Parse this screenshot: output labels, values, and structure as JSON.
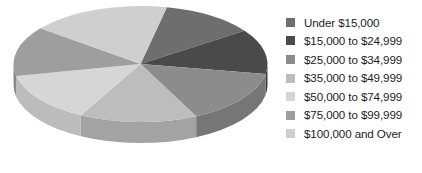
{
  "chart_data": {
    "type": "pie",
    "title": "",
    "subtitle": "",
    "xlabel": "",
    "ylabel": "",
    "three_d": true,
    "start_angle_deg": 12,
    "direction": "clockwise",
    "legend_position": "right",
    "grid": false,
    "categories": [
      "Under $15,000",
      "$15,000 to $24,999",
      "$25,000 to $34,999",
      "$35,000 to $49,999",
      "$50,000 to $74,999",
      "$75,000 to $99,999",
      "$100,000 and Over"
    ],
    "values": [
      12,
      12.5,
      15,
      15,
      14,
      14,
      17.5
    ],
    "slice_angles_deg": [
      43,
      45,
      54,
      54,
      50,
      50,
      64
    ],
    "colors": [
      "#6e6e6e",
      "#4a4a4a",
      "#8c8c8c",
      "#bdbdbd",
      "#d6d6d6",
      "#9e9e9e",
      "#cfcfcf"
    ],
    "side_colors": [
      "#5a5a5a",
      "#3b3b3b",
      "#767676",
      "#a3a3a3",
      "#bcbcbc",
      "#8a8a8a",
      "#b4b4b4"
    ]
  },
  "legend": {
    "items": [
      {
        "label": "Under $15,000",
        "color": "#6e6e6e"
      },
      {
        "label": "$15,000 to $24,999",
        "color": "#4a4a4a"
      },
      {
        "label": "$25,000 to $34,999",
        "color": "#8c8c8c"
      },
      {
        "label": "$35,000 to $49,999",
        "color": "#bdbdbd"
      },
      {
        "label": "$50,000 to $74,999",
        "color": "#d6d6d6"
      },
      {
        "label": "$75,000 to $99,999",
        "color": "#9e9e9e"
      },
      {
        "label": "$100,000 and Over",
        "color": "#cfcfcf"
      }
    ]
  },
  "geometry": {
    "cx": 140.5,
    "cy": 64,
    "rx": 127,
    "ry": 58,
    "depth": 21
  }
}
